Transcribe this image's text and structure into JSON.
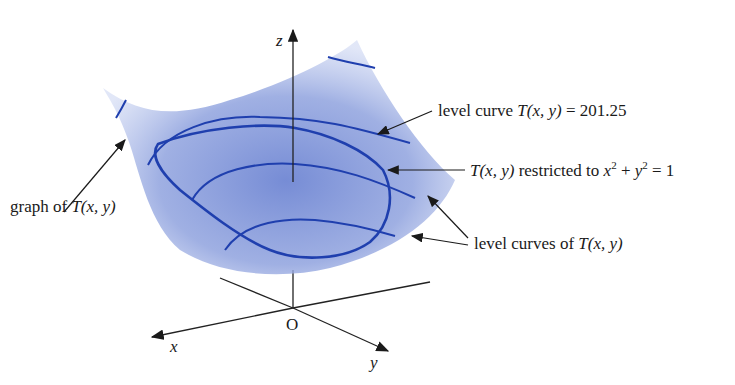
{
  "figure": {
    "axes": {
      "z": "z",
      "x": "x",
      "y": "y",
      "origin": "O"
    },
    "labels": {
      "graph": {
        "prefix": "graph of ",
        "func": "T(x, y)"
      },
      "level_curve": {
        "prefix": "level curve ",
        "func": "T(x, y)",
        "suffix": " = 201.25"
      },
      "restricted": {
        "func": "T(x, y)",
        "mid": " restricted to ",
        "x": "x",
        "plus": " + ",
        "y": "y",
        "eq": " = 1",
        "exp": "2"
      },
      "level_curves": {
        "prefix": "level curves of ",
        "func": "T(x, y)"
      }
    },
    "colors": {
      "surface": "#7e93d8",
      "curve": "#1f3fae",
      "ink": "#1a1a1a"
    }
  }
}
